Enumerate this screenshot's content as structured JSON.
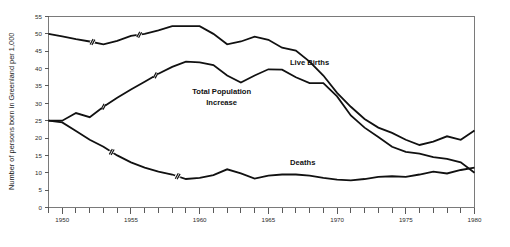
{
  "chart_data": {
    "type": "line",
    "title": "",
    "xlabel": "",
    "ylabel": "Number of persons born in Greenland per 1,000",
    "xlim": [
      1949,
      1980
    ],
    "ylim": [
      0,
      55
    ],
    "grid": false,
    "legend_position": "inline-annotations",
    "y_ticks": [
      0,
      5,
      10,
      15,
      20,
      25,
      30,
      35,
      40,
      45,
      50,
      55
    ],
    "y_tick_labels": [
      "0",
      "5",
      "10",
      "15",
      "20",
      "25",
      "30",
      "35",
      "40",
      "45",
      "50",
      "55"
    ],
    "x_ticks": [
      1949,
      1950,
      1951,
      1952,
      1953,
      1954,
      1955,
      1956,
      1957,
      1958,
      1959,
      1960,
      1961,
      1962,
      1963,
      1964,
      1965,
      1966,
      1967,
      1968,
      1969,
      1970,
      1971,
      1972,
      1973,
      1974,
      1975,
      1976,
      1977,
      1978,
      1979,
      1980
    ],
    "x_labeled_ticks": [
      1950,
      1955,
      1960,
      1965,
      1970,
      1975,
      1980
    ],
    "x_tick_labels": [
      "1950",
      "1955",
      "1960",
      "1965",
      "1970",
      "1975",
      "1980"
    ],
    "series": [
      {
        "name": "Live Births",
        "label": "Live Births",
        "label_x": 1968.0,
        "label_y": 41.0,
        "color": "#111111",
        "x": [
          1949,
          1950,
          1951,
          1952,
          1953,
          1954,
          1955,
          1956,
          1957,
          1958,
          1959,
          1960,
          1961,
          1962,
          1963,
          1964,
          1965,
          1966,
          1967,
          1968,
          1969,
          1970,
          1971,
          1972,
          1973,
          1974,
          1975,
          1976,
          1977,
          1978,
          1979,
          1980
        ],
        "values": [
          50.0,
          49.3,
          48.5,
          47.8,
          47.0,
          48.0,
          49.4,
          50.0,
          51.0,
          52.2,
          52.2,
          52.2,
          50.0,
          47.0,
          47.8,
          49.2,
          48.3,
          46.0,
          45.2,
          42.0,
          38.0,
          33.0,
          29.0,
          25.5,
          23.0,
          21.5,
          19.5,
          18.0,
          19.0,
          20.5,
          19.5,
          22.2
        ],
        "break_marks": [
          1952.2,
          1955.6
        ]
      },
      {
        "name": "Total Population Increase",
        "label": "Total Population Increase",
        "label_x": 1961.6,
        "label_y": 32.0,
        "color": "#111111",
        "x": [
          1949,
          1950,
          1951,
          1952,
          1953,
          1954,
          1955,
          1956,
          1957,
          1958,
          1959,
          1960,
          1961,
          1962,
          1963,
          1964,
          1965,
          1966,
          1967,
          1968,
          1969,
          1970,
          1971,
          1972,
          1973,
          1974,
          1975,
          1976,
          1977,
          1978,
          1979,
          1980
        ],
        "values": [
          25.0,
          25.0,
          27.2,
          26.0,
          29.0,
          31.6,
          34.0,
          36.2,
          38.5,
          40.5,
          42.0,
          41.8,
          41.0,
          38.0,
          36.0,
          38.0,
          39.8,
          39.7,
          37.5,
          35.8,
          35.8,
          32.0,
          26.5,
          23.0,
          20.3,
          17.5,
          16.0,
          15.5,
          14.5,
          14.0,
          13.0,
          10.0
        ],
        "break_marks": [
          1953.0,
          1956.8
        ]
      },
      {
        "name": "Deaths",
        "label": "Deaths",
        "label_x": 1967.5,
        "label_y": 12.2,
        "color": "#111111",
        "x": [
          1949,
          1950,
          1951,
          1952,
          1953,
          1954,
          1955,
          1956,
          1957,
          1958,
          1959,
          1960,
          1961,
          1962,
          1963,
          1964,
          1965,
          1966,
          1967,
          1968,
          1969,
          1970,
          1971,
          1972,
          1973,
          1974,
          1975,
          1976,
          1977,
          1978,
          1979,
          1980
        ],
        "values": [
          25.0,
          24.5,
          22.0,
          19.5,
          17.5,
          15.0,
          13.0,
          11.5,
          10.3,
          9.5,
          8.2,
          8.5,
          9.3,
          11.0,
          9.8,
          8.3,
          9.2,
          9.5,
          9.5,
          9.2,
          8.5,
          8.0,
          7.8,
          8.2,
          8.8,
          9.0,
          8.8,
          9.5,
          10.3,
          9.8,
          10.8,
          11.5
        ],
        "break_marks": [
          1953.6,
          1958.4
        ]
      }
    ],
    "annotations": [
      {
        "text": "Live Births",
        "x": 1968.0,
        "y": 41.0
      },
      {
        "text": "Total Population",
        "x": 1961.6,
        "y": 32.6
      },
      {
        "text": "Increase",
        "x": 1961.6,
        "y": 29.4
      },
      {
        "text": "Deaths",
        "x": 1967.5,
        "y": 12.2
      }
    ]
  },
  "labels": {
    "y_axis_title": "Number of persons born in Greenland per 1,000",
    "live_births": "Live Births",
    "total_population_line1": "Total Population",
    "total_population_line2": "Increase",
    "deaths": "Deaths"
  },
  "colors": {
    "line": "#111111",
    "axis": "#7a7a7a",
    "text": "#1a1a1a",
    "background": "#ffffff"
  }
}
